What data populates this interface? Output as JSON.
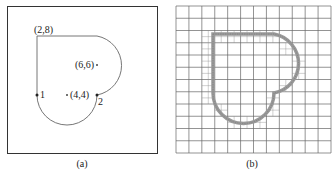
{
  "panels": [
    {
      "id": "a",
      "caption": "(a)",
      "labels": {
        "top_left_corner": "(2,8)",
        "upper_arc_center": "(6,6)",
        "lower_arc_center": "(4,4)",
        "point_1": "1",
        "point_2": "2"
      },
      "geometry_data_units": {
        "corner": [
          2,
          8
        ],
        "upper_arc_center": [
          6,
          6
        ],
        "upper_arc_radius": 2,
        "lower_arc_center": [
          4,
          4
        ],
        "lower_arc_radius": 2,
        "point_1": [
          2,
          4
        ],
        "point_2": [
          6,
          4
        ]
      }
    },
    {
      "id": "b",
      "caption": "(b)",
      "grid_cells": [
        12,
        12
      ],
      "description": "Adaptively refined quadtree mesh around the shape boundary"
    }
  ],
  "colors": {
    "stroke": "#555555",
    "grid": "#666666",
    "refined": "#8a8a8a"
  }
}
